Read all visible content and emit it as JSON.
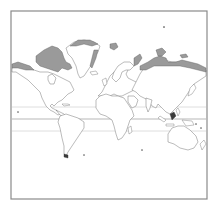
{
  "map": {
    "projection": "mercator",
    "extent": "world",
    "colors": {
      "background": "#ffffff",
      "frame": "#8a8a8a",
      "coastline": "#6a6a6a",
      "shaded_region": "#9a9a9a",
      "equator_line": "#9a9a9a",
      "tropic_lines": "#d6d6d6"
    },
    "reference_lines": [
      {
        "name": "tropic-of-cancer",
        "y": 107
      },
      {
        "name": "equator",
        "y": 119
      },
      {
        "name": "tropic-of-capricorn",
        "y": 131
      }
    ],
    "shaded_regions": [
      "canadian-arctic-archipelago",
      "greenland-coast",
      "svalbard",
      "siberian-arctic-coast",
      "novaya-zemlya"
    ],
    "frame": {
      "x": 11,
      "y": 11,
      "width": 196,
      "height": 188
    }
  }
}
